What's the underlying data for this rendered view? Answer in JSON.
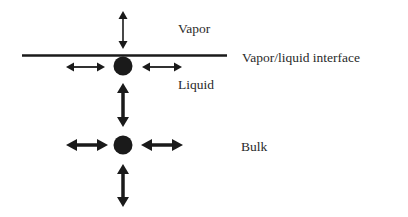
{
  "diagram": {
    "colors": {
      "ink": "#1a1a1a",
      "text": "#2a2a2a",
      "background": "#ffffff"
    },
    "labels": {
      "vapor": "Vapor",
      "interface": "Vapor/liquid interface",
      "liquid": "Liquid",
      "bulk": "Bulk"
    },
    "nodes": [
      {
        "id": "surface-molecule",
        "x": 123,
        "y": 66,
        "r": 9
      },
      {
        "id": "bulk-molecule",
        "x": 123,
        "y": 145,
        "r": 9
      }
    ],
    "interface_line": {
      "x1": 22,
      "y1": 55.5,
      "x2": 227,
      "y2": 55.5
    },
    "arrows": [
      {
        "id": "vapor-vertical",
        "orientation": "vertical",
        "weight": "thin"
      },
      {
        "id": "surface-left",
        "orientation": "horizontal",
        "weight": "thin"
      },
      {
        "id": "surface-right",
        "orientation": "horizontal",
        "weight": "thin"
      },
      {
        "id": "surface-bulk-vertical",
        "orientation": "vertical",
        "weight": "thick"
      },
      {
        "id": "bulk-left",
        "orientation": "horizontal",
        "weight": "thick"
      },
      {
        "id": "bulk-right",
        "orientation": "horizontal",
        "weight": "thick"
      },
      {
        "id": "bulk-down",
        "orientation": "vertical",
        "weight": "thick"
      }
    ]
  }
}
